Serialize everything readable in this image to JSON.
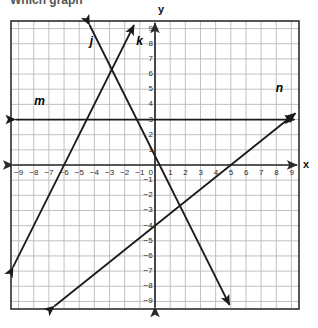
{
  "figure": {
    "kind": "coordinate-plane-graph",
    "top_cropped_text": "Which graph",
    "background_color": "#ffffff",
    "grid_color": "#b9b9bd",
    "border_color": "#2d2d2d",
    "axis_color": "#2b2b2b",
    "line_color": "#1a1a1a",
    "tick_label_color": "#2b2b2b"
  },
  "axes": {
    "x_axis_label": "x",
    "y_axis_label": "y",
    "x_tick_labels": [
      "-9",
      "-8",
      "-7",
      "-6",
      "-5",
      "-4",
      "-3",
      "-2",
      "-1",
      "0",
      "1",
      "2",
      "3",
      "4",
      "5",
      "6",
      "7",
      "8",
      "9"
    ],
    "y_tick_labels": [
      "9",
      "8",
      "7",
      "6",
      "5",
      "4",
      "3",
      "2",
      "1",
      "0",
      "-1",
      "-2",
      "-3",
      "-4",
      "-5",
      "-6",
      "-7",
      "-8",
      "-9"
    ],
    "origin_label": "0",
    "xlim": [
      -9.5,
      9.5
    ],
    "ylim": [
      -9.5,
      9.5
    ],
    "grid": true,
    "grid_step": 1
  },
  "line_labels": {
    "j": "j",
    "k": "k",
    "m": "m",
    "n": "n"
  },
  "chart_data": {
    "type": "line",
    "title": "",
    "xlabel": "x",
    "ylabel": "y",
    "xlim": [
      -9.5,
      9.5
    ],
    "ylim": [
      -9.5,
      9.5
    ],
    "grid": true,
    "legend": "inline-labels",
    "series": [
      {
        "name": "j",
        "label": "j",
        "slope": 2,
        "y_intercept": 12,
        "x_intercept": -6,
        "equation": "y = 2x + 12",
        "points": [
          [
            -6,
            0
          ],
          [
            -3,
            6
          ],
          [
            -8,
            -4
          ],
          [
            -9,
            -6
          ]
        ],
        "arrows": "both",
        "label_position": [
          -4.2,
          8.2
        ]
      },
      {
        "name": "k",
        "label": "k",
        "slope": -2,
        "y_intercept": 0.6,
        "x_intercept": 0.3,
        "equation": "y = -2x + 0.6",
        "points": [
          [
            -3,
            6.6
          ],
          [
            0,
            0.6
          ],
          [
            3,
            -5.4
          ]
        ],
        "arrows": "both",
        "label_position": [
          -1.0,
          8.2
        ]
      },
      {
        "name": "m",
        "label": "m",
        "slope": 0,
        "y_intercept": 3,
        "equation": "y = 3",
        "points": [
          [
            -9.5,
            3
          ],
          [
            9.5,
            3
          ]
        ],
        "arrows": "both",
        "label_position": [
          -7.6,
          4.2
        ]
      },
      {
        "name": "n",
        "label": "n",
        "slope": 0.8,
        "y_intercept": -4,
        "x_intercept": 5,
        "equation": "y = 0.8x - 4",
        "points": [
          [
            0,
            -4
          ],
          [
            5,
            0
          ],
          [
            9.5,
            3.6
          ]
        ],
        "arrows": "both",
        "label_position": [
          8.2,
          5.1
        ]
      }
    ]
  }
}
